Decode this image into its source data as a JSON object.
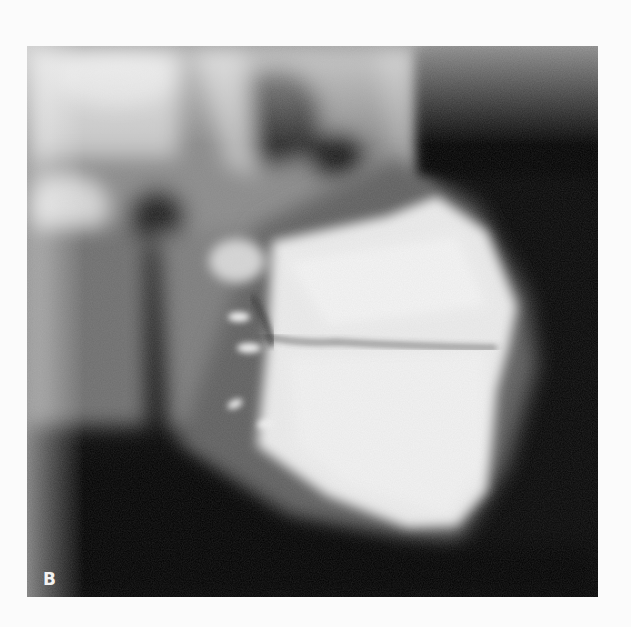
{
  "figure": {
    "panel_label": "B",
    "colors": {
      "background": "#fbfbfb",
      "film_dark": "#050505",
      "bone_bright": "#f0f0f0",
      "soft_tissue_gray": "#6a6a6a"
    }
  }
}
